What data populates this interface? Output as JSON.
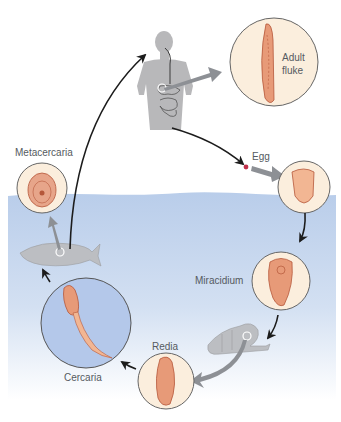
{
  "diagram": {
    "type": "life-cycle",
    "colors": {
      "water_top": "#b9cdea",
      "water_bottom": "#f2f6fc",
      "human_silhouette": "#b8b8ba",
      "stage_circle_fill": "#fbeedd",
      "cercaria_circle_fill": "#b4c8ea",
      "organism": "#e79a78",
      "organism_outline": "#b5573a",
      "arrow_black": "#1c1c1c",
      "arrow_gray": "#8d9095",
      "egg_dot": "#c0304a"
    },
    "hosts": [
      {
        "id": "human",
        "name": "human"
      },
      {
        "id": "snail",
        "name": "snail"
      },
      {
        "id": "fish",
        "name": "fish"
      }
    ],
    "stages": [
      {
        "id": "adult",
        "label_line1": "Adult",
        "label_line2": "fluke"
      },
      {
        "id": "egg",
        "label": "Egg"
      },
      {
        "id": "miracidium",
        "label": "Miracidium"
      },
      {
        "id": "redia",
        "label": "Redia"
      },
      {
        "id": "cercaria",
        "label": "Cercaria"
      },
      {
        "id": "metacercaria",
        "label": "Metacercaria"
      }
    ],
    "flow": [
      "human → adult fluke",
      "human → egg",
      "egg → egg (magnified)",
      "egg → miracidium",
      "miracidium → snail",
      "snail → redia",
      "redia → cercaria",
      "cercaria → fish",
      "fish → metacercaria",
      "fish → human"
    ]
  }
}
